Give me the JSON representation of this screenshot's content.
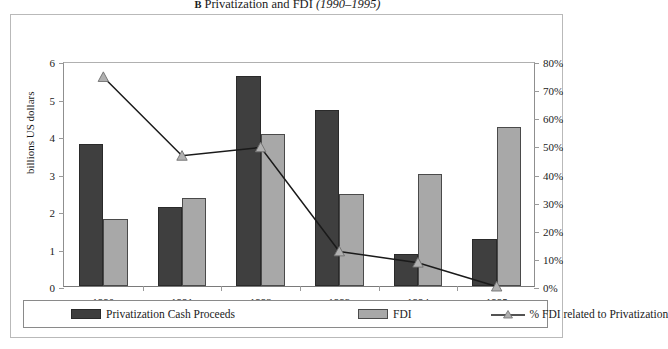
{
  "figure": {
    "panel_label": "B",
    "title": "Privatization and FDI",
    "period": "(1990–1995)"
  },
  "axes": {
    "left_title": "billions US dollars",
    "left_ticks": [
      "6",
      "5",
      "4",
      "3",
      "2",
      "1",
      "0"
    ],
    "right_ticks": [
      "80%",
      "70%",
      "60%",
      "50%",
      "40%",
      "30%",
      "20%",
      "10%",
      "0%"
    ],
    "x_ticks": [
      "1990",
      "1991",
      "1992",
      "1993",
      "1994",
      "1995"
    ]
  },
  "legend": {
    "items": [
      {
        "label": "Privatization Cash Proceeds",
        "marker": "dark-square-swatch"
      },
      {
        "label": "FDI",
        "marker": "light-square-swatch"
      },
      {
        "label": "% FDI related to Privatization",
        "marker": "line-triangle-marker"
      }
    ]
  },
  "colors": {
    "proceeds_fill": "#3f3f3f",
    "proceeds_stroke": "#2a2a2a",
    "fdi_fill": "#a8a8a8",
    "fdi_stroke": "#4a4a4a",
    "line_stroke": "#1a1a1a",
    "marker_fill": "#b0b0b0",
    "axis": "#8f8f8f",
    "frame": "#b9b9b9"
  },
  "chart_data": {
    "type": "bar",
    "xlabel": "",
    "ylabel": "billions US dollars",
    "y2label": "",
    "categories": [
      "1990",
      "1991",
      "1992",
      "1993",
      "1994",
      "1995"
    ],
    "ylim": [
      0,
      6
    ],
    "y2lim": [
      0,
      80
    ],
    "grid": false,
    "legend_position": "bottom",
    "series": [
      {
        "name": "Privatization Cash Proceeds",
        "type": "bar",
        "axis": "left",
        "unit": "billions US dollars",
        "values": [
          3.8,
          2.1,
          5.6,
          4.7,
          0.85,
          1.25
        ]
      },
      {
        "name": "FDI",
        "type": "bar",
        "axis": "left",
        "unit": "billions US dollars",
        "values": [
          1.8,
          2.35,
          4.05,
          2.45,
          3.0,
          4.25
        ]
      },
      {
        "name": "% FDI related to Privatization",
        "type": "line",
        "axis": "right",
        "unit": "%",
        "values": [
          75,
          47,
          50,
          13,
          9,
          0.5
        ]
      }
    ]
  }
}
